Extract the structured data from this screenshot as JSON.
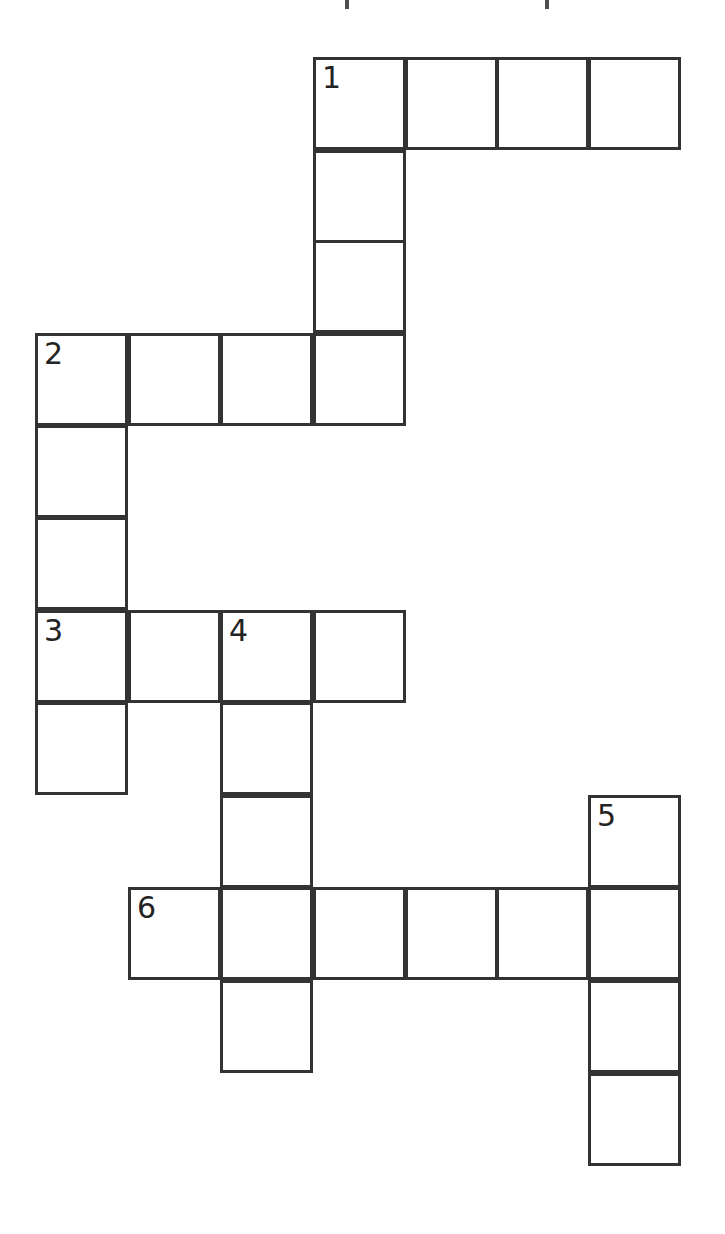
{
  "page": {
    "type": "crossword-puzzle-grid",
    "background_color": "#ffffff",
    "grid_line_color": "#333333",
    "number_color": "#232323",
    "cell_size_px": 93,
    "line_width_px": 3
  },
  "grid": {
    "columns_x": [
      35,
      128,
      220,
      313,
      405,
      496,
      588
    ],
    "rows_y": [
      57,
      150,
      240,
      333,
      425,
      517,
      610,
      702,
      795,
      887,
      980,
      1073
    ],
    "cells": [
      {
        "id": "c-r0-c3",
        "row": 0,
        "col": 3,
        "x": 313,
        "y": 57,
        "number": "1",
        "letter": ""
      },
      {
        "id": "c-r0-c4",
        "row": 0,
        "col": 4,
        "x": 405,
        "y": 57,
        "number": "",
        "letter": ""
      },
      {
        "id": "c-r0-c5",
        "row": 0,
        "col": 5,
        "x": 496,
        "y": 57,
        "number": "",
        "letter": ""
      },
      {
        "id": "c-r0-c6",
        "row": 0,
        "col": 6,
        "x": 588,
        "y": 57,
        "number": "",
        "letter": ""
      },
      {
        "id": "c-r1-c3",
        "row": 1,
        "col": 3,
        "x": 313,
        "y": 150,
        "number": "",
        "letter": ""
      },
      {
        "id": "c-r2-c3",
        "row": 2,
        "col": 3,
        "x": 313,
        "y": 240,
        "number": "",
        "letter": ""
      },
      {
        "id": "c-r3-c0",
        "row": 3,
        "col": 0,
        "x": 35,
        "y": 333,
        "number": "2",
        "letter": ""
      },
      {
        "id": "c-r3-c1",
        "row": 3,
        "col": 1,
        "x": 128,
        "y": 333,
        "number": "",
        "letter": ""
      },
      {
        "id": "c-r3-c2",
        "row": 3,
        "col": 2,
        "x": 220,
        "y": 333,
        "number": "",
        "letter": ""
      },
      {
        "id": "c-r3-c3",
        "row": 3,
        "col": 3,
        "x": 313,
        "y": 333,
        "number": "",
        "letter": ""
      },
      {
        "id": "c-r4-c0",
        "row": 4,
        "col": 0,
        "x": 35,
        "y": 425,
        "number": "",
        "letter": ""
      },
      {
        "id": "c-r5-c0",
        "row": 5,
        "col": 0,
        "x": 35,
        "y": 517,
        "number": "",
        "letter": ""
      },
      {
        "id": "c-r6-c0",
        "row": 6,
        "col": 0,
        "x": 35,
        "y": 610,
        "number": "3",
        "letter": ""
      },
      {
        "id": "c-r6-c1",
        "row": 6,
        "col": 1,
        "x": 128,
        "y": 610,
        "number": "",
        "letter": ""
      },
      {
        "id": "c-r6-c2",
        "row": 6,
        "col": 2,
        "x": 220,
        "y": 610,
        "number": "4",
        "letter": ""
      },
      {
        "id": "c-r6-c3",
        "row": 6,
        "col": 3,
        "x": 313,
        "y": 610,
        "number": "",
        "letter": ""
      },
      {
        "id": "c-r7-c0",
        "row": 7,
        "col": 0,
        "x": 35,
        "y": 702,
        "number": "",
        "letter": ""
      },
      {
        "id": "c-r7-c2",
        "row": 7,
        "col": 2,
        "x": 220,
        "y": 702,
        "number": "",
        "letter": ""
      },
      {
        "id": "c-r8-c2",
        "row": 8,
        "col": 2,
        "x": 220,
        "y": 795,
        "number": "",
        "letter": ""
      },
      {
        "id": "c-r8-c6",
        "row": 8,
        "col": 6,
        "x": 588,
        "y": 795,
        "number": "5",
        "letter": ""
      },
      {
        "id": "c-r9-c1",
        "row": 9,
        "col": 1,
        "x": 128,
        "y": 887,
        "number": "6",
        "letter": ""
      },
      {
        "id": "c-r9-c2",
        "row": 9,
        "col": 2,
        "x": 220,
        "y": 887,
        "number": "",
        "letter": ""
      },
      {
        "id": "c-r9-c3",
        "row": 9,
        "col": 3,
        "x": 313,
        "y": 887,
        "number": "",
        "letter": ""
      },
      {
        "id": "c-r9-c4",
        "row": 9,
        "col": 4,
        "x": 405,
        "y": 887,
        "number": "",
        "letter": ""
      },
      {
        "id": "c-r9-c5",
        "row": 9,
        "col": 5,
        "x": 496,
        "y": 887,
        "number": "",
        "letter": ""
      },
      {
        "id": "c-r9-c6",
        "row": 9,
        "col": 6,
        "x": 588,
        "y": 887,
        "number": "",
        "letter": ""
      },
      {
        "id": "c-r10-c2",
        "row": 10,
        "col": 2,
        "x": 220,
        "y": 980,
        "number": "",
        "letter": ""
      },
      {
        "id": "c-r10-c6",
        "row": 10,
        "col": 6,
        "x": 588,
        "y": 980,
        "number": "",
        "letter": ""
      },
      {
        "id": "c-r11-c6",
        "row": 11,
        "col": 6,
        "x": 588,
        "y": 1073,
        "number": "",
        "letter": ""
      }
    ],
    "entries": [
      {
        "number": "1",
        "direction": "across",
        "start_x": 313,
        "start_y": 57,
        "length": 4
      },
      {
        "number": "1",
        "direction": "down",
        "start_x": 313,
        "start_y": 57,
        "length": 4
      },
      {
        "number": "2",
        "direction": "across",
        "start_x": 35,
        "start_y": 333,
        "length": 4
      },
      {
        "number": "2",
        "direction": "down",
        "start_x": 35,
        "start_y": 333,
        "length": 5
      },
      {
        "number": "3",
        "direction": "across",
        "start_x": 35,
        "start_y": 610,
        "length": 4
      },
      {
        "number": "4",
        "direction": "down",
        "start_x": 220,
        "start_y": 610,
        "length": 5
      },
      {
        "number": "5",
        "direction": "down",
        "start_x": 588,
        "start_y": 795,
        "length": 4
      },
      {
        "number": "6",
        "direction": "across",
        "start_x": 128,
        "start_y": 887,
        "length": 6
      }
    ]
  },
  "artifacts": {
    "title_specks": [
      {
        "x": 345,
        "y": 0,
        "w": 4,
        "h": 9
      },
      {
        "x": 545,
        "y": 0,
        "w": 4,
        "h": 9
      }
    ]
  }
}
